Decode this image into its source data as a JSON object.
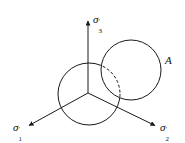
{
  "diagram": {
    "title": "",
    "colors": {
      "stroke": "#1a1a1a",
      "background": "#ffffff"
    },
    "origin": {
      "x": 88,
      "y": 93
    },
    "axes": [
      {
        "id": "sigma3",
        "symbol": "σ",
        "subscript": "3",
        "prime": "′",
        "end": {
          "x": 88,
          "y": 20
        }
      },
      {
        "id": "sigma1",
        "symbol": "σ",
        "subscript": "1",
        "prime": "′",
        "end": {
          "x": 28,
          "y": 126
        }
      },
      {
        "id": "sigma2",
        "symbol": "σ",
        "subscript": "2",
        "prime": "′",
        "end": {
          "x": 156,
          "y": 126
        }
      }
    ],
    "circles": [
      {
        "id": "circle-origin",
        "cx": 89,
        "cy": 94,
        "r": 31,
        "dashed_inside_other": true
      },
      {
        "id": "circle-A",
        "cx": 131,
        "cy": 70,
        "r": 30,
        "label": "A"
      }
    ],
    "labels": {
      "sigma3": {
        "sym": "σ",
        "sub": "3",
        "prime": "′"
      },
      "sigma1": {
        "sym": "σ",
        "sub": "1",
        "prime": "′"
      },
      "sigma2": {
        "sym": "σ",
        "sub": "2",
        "prime": "′"
      },
      "A": "A"
    }
  }
}
